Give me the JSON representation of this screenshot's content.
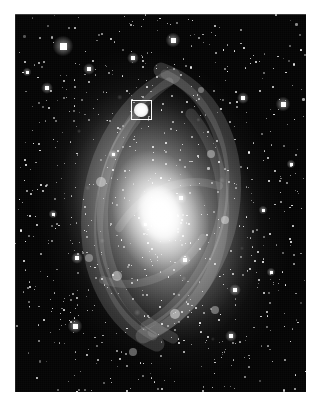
{
  "figure": {
    "kind": "astronomical-image",
    "caption": "",
    "colorspace": "grayscale",
    "background_color": "#ffffff",
    "sky_color": "#000000",
    "star_color": "#ffffff",
    "marker_color": "#ffffff"
  },
  "plate": {
    "x": 15,
    "y": 14,
    "width": 291,
    "height": 378
  },
  "galaxy": {
    "center_x": 0.5,
    "center_y": 0.53,
    "position_angle_deg": -18,
    "nucleus_label": "",
    "halo_label": "",
    "arm_label": ""
  },
  "roi": {
    "label": "",
    "x": 116,
    "y": 86,
    "width": 21,
    "height": 20,
    "stroke_px": 1.5,
    "knot_label": ""
  },
  "arms": [
    {
      "d": "M 146 56 C 196 74 223 126 218 186 C 213 246 176 300 128 322",
      "w": 15,
      "o": 0.16
    },
    {
      "d": "M 150 60 C 192 80 214 128 209 182 C 204 238 172 288 130 312",
      "w": 9,
      "o": 0.13
    },
    {
      "d": "M 142 330 C 96 310 70 258 74 198 C 78 136 112 82 158 62",
      "w": 15,
      "o": 0.15
    },
    {
      "d": "M 138 322 C 100 302 80 254 84 200 C 88 144 118 92 154 68",
      "w": 9,
      "o": 0.12
    },
    {
      "d": "M 120 106 C 92 140 82 186 90 232 C 98 276 124 308 158 324",
      "w": 11,
      "o": 0.14
    },
    {
      "d": "M 176 100 C 204 134 214 180 206 226 C 198 270 172 302 138 318",
      "w": 11,
      "o": 0.12
    },
    {
      "d": "M 104 214 C 128 176 168 160 204 172",
      "w": 8,
      "o": 0.12
    },
    {
      "d": "M 188 224 C 164 262 124 278 88 266",
      "w": 8,
      "o": 0.12
    }
  ],
  "knots": [
    {
      "x": 126,
      "y": 96,
      "r": 7,
      "o": 0.85
    },
    {
      "x": 86,
      "y": 168,
      "r": 5,
      "o": 0.4
    },
    {
      "x": 196,
      "y": 140,
      "r": 4,
      "o": 0.38
    },
    {
      "x": 210,
      "y": 206,
      "r": 4,
      "o": 0.4
    },
    {
      "x": 102,
      "y": 262,
      "r": 5,
      "o": 0.42
    },
    {
      "x": 160,
      "y": 300,
      "r": 5,
      "o": 0.45
    },
    {
      "x": 200,
      "y": 296,
      "r": 4,
      "o": 0.36
    },
    {
      "x": 74,
      "y": 244,
      "r": 4,
      "o": 0.34
    },
    {
      "x": 186,
      "y": 76,
      "r": 3,
      "o": 0.32
    },
    {
      "x": 118,
      "y": 338,
      "r": 4,
      "o": 0.36
    }
  ],
  "bright_stars": [
    {
      "x": 48,
      "y": 32,
      "s": 7
    },
    {
      "x": 74,
      "y": 55,
      "s": 4
    },
    {
      "x": 32,
      "y": 74,
      "s": 4
    },
    {
      "x": 118,
      "y": 44,
      "s": 4
    },
    {
      "x": 158,
      "y": 26,
      "s": 5
    },
    {
      "x": 228,
      "y": 84,
      "s": 4
    },
    {
      "x": 268,
      "y": 90,
      "s": 5
    },
    {
      "x": 12,
      "y": 58,
      "s": 3
    },
    {
      "x": 62,
      "y": 244,
      "s": 4
    },
    {
      "x": 60,
      "y": 312,
      "s": 5
    },
    {
      "x": 166,
      "y": 184,
      "s": 4
    },
    {
      "x": 170,
      "y": 246,
      "s": 4
    },
    {
      "x": 220,
      "y": 276,
      "s": 4
    },
    {
      "x": 216,
      "y": 322,
      "s": 4
    },
    {
      "x": 248,
      "y": 196,
      "s": 3
    },
    {
      "x": 256,
      "y": 258,
      "s": 3
    },
    {
      "x": 98,
      "y": 140,
      "s": 3
    },
    {
      "x": 130,
      "y": 210,
      "s": 3
    },
    {
      "x": 276,
      "y": 150,
      "s": 3
    },
    {
      "x": 38,
      "y": 200,
      "s": 3
    }
  ],
  "star_field": {
    "count": 900,
    "min_size": 0.6,
    "max_size": 2.2,
    "seed": 20240517
  }
}
